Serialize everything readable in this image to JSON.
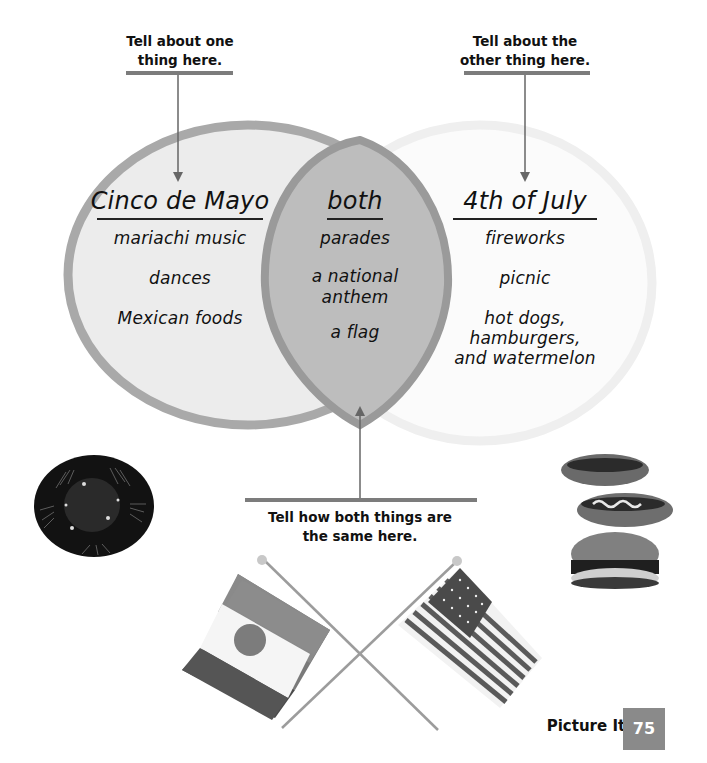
{
  "callouts": {
    "left": {
      "line1": "Tell about one",
      "line2": "thing here."
    },
    "right": {
      "line1": "Tell about the",
      "line2": "other thing here."
    },
    "bottom": {
      "line1": "Tell how both things are",
      "line2": "the same here."
    }
  },
  "venn": {
    "left": {
      "title": "Cinco de Mayo",
      "items": [
        "mariachi music",
        "dances",
        "Mexican foods"
      ]
    },
    "middle": {
      "title": "both",
      "items": [
        "parades",
        "a national anthem",
        "a flag"
      ],
      "item_lines": [
        [
          "parades"
        ],
        [
          "a national",
          "anthem"
        ],
        [
          "a flag"
        ]
      ]
    },
    "right": {
      "title": "4th of July",
      "items": [
        "fireworks",
        "picnic",
        "hot dogs, hamburgers, and watermelon"
      ],
      "item_lines": [
        [
          "fireworks"
        ],
        [
          "picnic"
        ],
        [
          "hot dogs,",
          "hamburgers,",
          "and watermelon"
        ]
      ]
    },
    "colors": {
      "left_fill": "#ececec",
      "left_stroke": "#a9a9a9",
      "middle_fill": "#bdbdbd",
      "middle_stroke": "#9a9a9a",
      "right_fill": "#fbfbfb",
      "right_stroke": "#f0f0f0"
    }
  },
  "images": {
    "sombrero": "sombrero photo",
    "food": "hot dogs and hamburger photo",
    "flags": "crossed Mexican and U.S. flags"
  },
  "footer": {
    "section": "Picture It!",
    "page_number": "75"
  }
}
